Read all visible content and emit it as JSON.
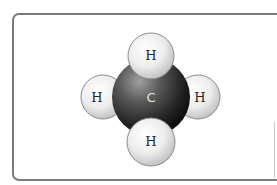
{
  "diagram": {
    "colors": {
      "frame_border": "#7a7a7a",
      "carbon_highlight": "#9a9a9a",
      "carbon_mid": "#4a4a4a",
      "carbon_shadow": "#0e0e0e",
      "hydrogen_highlight": "#ffffff",
      "hydrogen_mid": "#ececec",
      "hydrogen_shadow": "#bdbdbd",
      "hydrogen_outline": "#8c8c8c",
      "h_label": "#2a2a2a",
      "c_label": "#e6e6e6"
    },
    "atoms": {
      "carbon": {
        "label": "C",
        "cx": 151,
        "cy": 97,
        "r": 39
      },
      "hydrogen_top": {
        "label": "H",
        "cx": 151,
        "cy": 55,
        "r": 23
      },
      "hydrogen_left": {
        "label": "H",
        "cx": 103,
        "cy": 97,
        "r": 22
      },
      "hydrogen_right": {
        "label": "H",
        "cx": 198,
        "cy": 97,
        "r": 22
      },
      "hydrogen_bottom": {
        "label": "H",
        "cx": 151,
        "cy": 141,
        "r": 24
      }
    }
  }
}
